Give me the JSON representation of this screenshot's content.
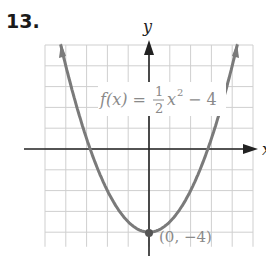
{
  "problem_number": "13.",
  "chart_data": {
    "type": "line",
    "title": "",
    "function_label": "f(x) = 1/2 x^2 − 4",
    "label_parts": {
      "fx": "f(x) =",
      "num": "1",
      "den": "2",
      "x": "x",
      "exp": "2",
      "rest": "− 4"
    },
    "xlabel": "x",
    "ylabel": "y",
    "xlim": [
      -5,
      5
    ],
    "ylim": [
      -4.7,
      5
    ],
    "grid": true,
    "grid_step": 1,
    "vertex": {
      "x": 0,
      "y": -4,
      "label": "(0, −4)"
    },
    "x_intercepts": [
      -2.83,
      2.83
    ],
    "x": [
      -4.6,
      -4,
      -3,
      -2,
      -1,
      0,
      1,
      2,
      3,
      4,
      4.6
    ],
    "y": [
      6.58,
      4,
      0.5,
      -2,
      -3.5,
      -4,
      -3.5,
      -2,
      0.5,
      4,
      6.58
    ],
    "colors": {
      "curve": "#7a7a7a",
      "axes": "#222222",
      "grid": "#cfcfcf",
      "label": "#8a8a8a"
    }
  }
}
